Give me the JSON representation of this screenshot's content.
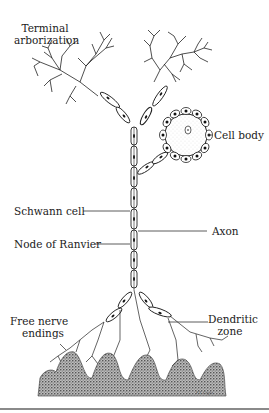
{
  "figure": {
    "labels": {
      "terminal_arborization_line1": "Terminal",
      "terminal_arborization_line2": "arborization",
      "cell_body": "Cell body",
      "schwann_cell": "Schwann cell",
      "axon": "Axon",
      "node_of_ranvier": "Node of Ranvier",
      "free_nerve_endings_line1": "Free nerve",
      "free_nerve_endings_line2": "endings",
      "dendritic_zone_line1": "Dendritic",
      "dendritic_zone_line2": "zone"
    },
    "signature": "F.T. Coyle",
    "colors": {
      "ink": "#1a1a1a",
      "tissue": "#555555",
      "rule": "#8a8a8a",
      "background": "#ffffff"
    }
  }
}
